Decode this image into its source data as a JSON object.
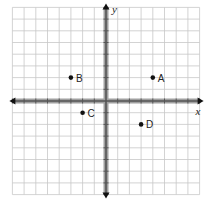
{
  "diagram": {
    "type": "coordinate-plane",
    "axes": {
      "x_label": "x",
      "y_label": "y"
    },
    "grid": {
      "x_min": -8,
      "x_max": 8,
      "y_min": -8,
      "y_max": 8,
      "step": 1
    },
    "points": [
      {
        "label": "A",
        "x": 4,
        "y": 2
      },
      {
        "label": "B",
        "x": -3,
        "y": 2
      },
      {
        "label": "C",
        "x": -2,
        "y": -1
      },
      {
        "label": "D",
        "x": 3,
        "y": -2
      }
    ],
    "colors": {
      "grid": "#c8c8c8",
      "axis": "#555555",
      "axis_shadow": "#a0a0a0",
      "point": "#111111"
    }
  }
}
